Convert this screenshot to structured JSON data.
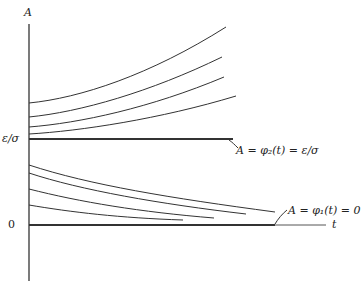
{
  "figure": {
    "axes": {
      "y_label": "A",
      "x_label": "t",
      "y_ticks": [
        "ε/σ",
        "0"
      ]
    },
    "equilibria": [
      {
        "id": "phi2",
        "label": "A = φ₂(t) = ε/σ",
        "level": "ε/σ"
      },
      {
        "id": "phi1",
        "label": "A = φ₁(t) = 0",
        "level": "0"
      }
    ],
    "trajectories": {
      "above_phi2": {
        "count": 4,
        "behavior": "diverge upward from ε/σ",
        "direction": "increasing t"
      },
      "between": {
        "count": 4,
        "behavior": "decay toward 0",
        "direction": "increasing t"
      }
    },
    "colors": {
      "ink": "#333333",
      "background": "#ffffff"
    }
  }
}
